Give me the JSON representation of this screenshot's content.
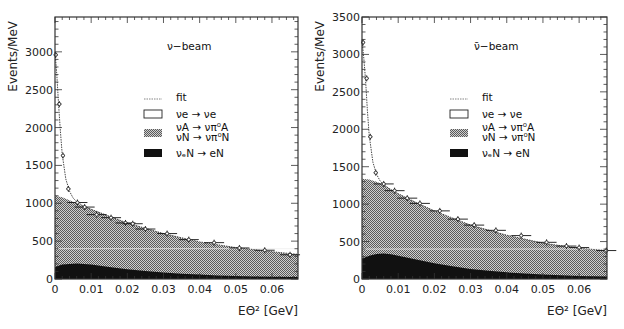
{
  "chart_data": [
    {
      "type": "area",
      "title": "ν−beam",
      "xlabel": "EΘ² [GeV]",
      "ylabel": "Events/MeV",
      "xlim": [
        0,
        0.0672
      ],
      "ylim": [
        0,
        3460
      ],
      "xticks": [
        0,
        0.01,
        0.02,
        0.03,
        0.04,
        0.05,
        0.06
      ],
      "xtick_labels": [
        "0",
        "0.01",
        "0.02",
        "0.03",
        "0.04",
        "0.05",
        "0.06"
      ],
      "yticks": [
        0,
        500,
        1000,
        1500,
        2000,
        2500,
        3000
      ],
      "ytick_labels": [
        "0",
        "500",
        "1000",
        "1500",
        "2000",
        "2500",
        "3000"
      ],
      "grid": false,
      "legend_position": "upper-right-center",
      "legend": [
        {
          "label": "fit",
          "style": "dotted-line"
        },
        {
          "label": "νe → νe",
          "style": "open-box"
        },
        {
          "label": "νA → νπ⁰A",
          "label2": "νN → νπ⁰N",
          "style": "hatched-box"
        },
        {
          "label": "νₑN → eN",
          "style": "solid-box"
        }
      ],
      "series": [
        {
          "name": "νₑN → eN",
          "fill": "#111111",
          "x": [
            0,
            0.002,
            0.004,
            0.006,
            0.008,
            0.01,
            0.015,
            0.02,
            0.025,
            0.03,
            0.035,
            0.04,
            0.045,
            0.05,
            0.055,
            0.06,
            0.0672
          ],
          "values": [
            160,
            190,
            200,
            205,
            200,
            190,
            160,
            130,
            105,
            85,
            70,
            58,
            48,
            40,
            34,
            30,
            25
          ]
        },
        {
          "name": "νA → νπ⁰A + νN → νπ⁰N (cumulative)",
          "fill": "#9a9a9a",
          "x": [
            0,
            0.002,
            0.004,
            0.006,
            0.008,
            0.01,
            0.015,
            0.02,
            0.025,
            0.03,
            0.035,
            0.04,
            0.045,
            0.05,
            0.055,
            0.06,
            0.065,
            0.0672
          ],
          "values": [
            1100,
            1080,
            1040,
            1000,
            960,
            920,
            830,
            740,
            665,
            600,
            540,
            490,
            450,
            415,
            385,
            360,
            330,
            325
          ]
        },
        {
          "name": "fit (total incl. νe → νe)",
          "x": [
            0,
            0.0005,
            0.001,
            0.0015,
            0.002,
            0.003,
            0.004,
            0.005,
            0.006,
            0.008,
            0.01,
            0.015,
            0.02,
            0.03,
            0.04,
            0.05,
            0.06,
            0.0672
          ],
          "values": [
            3000,
            2700,
            2300,
            1950,
            1650,
            1320,
            1160,
            1070,
            1020,
            960,
            920,
            830,
            740,
            600,
            490,
            415,
            360,
            325
          ]
        }
      ],
      "data_points": {
        "x": [
          0.0002,
          0.0012,
          0.0022,
          0.0037,
          0.0062,
          0.0082,
          0.0115,
          0.0155,
          0.0195,
          0.0215,
          0.025,
          0.031,
          0.037,
          0.044,
          0.051,
          0.058,
          0.065
        ],
        "y": [
          2960,
          2310,
          1630,
          1190,
          1010,
          950,
          850,
          810,
          740,
          730,
          660,
          600,
          520,
          480,
          410,
          380,
          320
        ]
      }
    },
    {
      "type": "area",
      "title": "ν̄−beam",
      "xlabel": "EΘ² [GeV]",
      "ylabel": "Events/MeV",
      "xlim": [
        0,
        0.0677
      ],
      "ylim": [
        0,
        3500
      ],
      "xticks": [
        0,
        0.01,
        0.02,
        0.03,
        0.04,
        0.05,
        0.06
      ],
      "xtick_labels": [
        "0",
        "0.01",
        "0.02",
        "0.03",
        "0.04",
        "0.05",
        "0.06"
      ],
      "yticks": [
        0,
        500,
        1000,
        1500,
        2000,
        2500,
        3000,
        3500
      ],
      "ytick_labels": [
        "0",
        "500",
        "1000",
        "1500",
        "2000",
        "2500",
        "3000",
        "3500"
      ],
      "grid": false,
      "legend_position": "upper-right-center",
      "legend": [
        {
          "label": "fit",
          "style": "dotted-line"
        },
        {
          "label": "νe → νe",
          "style": "open-box"
        },
        {
          "label": "νA → νπ⁰A",
          "label2": "νN → νπ⁰N",
          "style": "hatched-box"
        },
        {
          "label": "νₑN → eN",
          "style": "solid-box"
        }
      ],
      "series": [
        {
          "name": "νₑN → eN",
          "fill": "#111111",
          "x": [
            0,
            0.002,
            0.004,
            0.006,
            0.008,
            0.01,
            0.015,
            0.02,
            0.025,
            0.03,
            0.035,
            0.04,
            0.045,
            0.05,
            0.055,
            0.06,
            0.0677
          ],
          "values": [
            270,
            310,
            335,
            340,
            330,
            310,
            260,
            210,
            170,
            135,
            110,
            90,
            72,
            60,
            50,
            42,
            35
          ]
        },
        {
          "name": "νA → νπ⁰A + νN → νπ⁰N (cumulative)",
          "fill": "#9a9a9a",
          "x": [
            0,
            0.002,
            0.004,
            0.006,
            0.008,
            0.01,
            0.015,
            0.02,
            0.025,
            0.03,
            0.035,
            0.04,
            0.045,
            0.05,
            0.055,
            0.06,
            0.065,
            0.0677
          ],
          "values": [
            1340,
            1330,
            1300,
            1260,
            1200,
            1140,
            1020,
            910,
            810,
            720,
            650,
            585,
            530,
            480,
            440,
            410,
            385,
            380
          ]
        },
        {
          "name": "fit (total incl. νe → νe)",
          "x": [
            0,
            0.0005,
            0.001,
            0.0015,
            0.002,
            0.003,
            0.004,
            0.005,
            0.006,
            0.008,
            0.01,
            0.015,
            0.02,
            0.03,
            0.04,
            0.05,
            0.06,
            0.0677
          ],
          "values": [
            3200,
            2950,
            2650,
            2250,
            1920,
            1560,
            1400,
            1310,
            1260,
            1190,
            1140,
            1020,
            910,
            720,
            585,
            480,
            410,
            380
          ]
        }
      ],
      "data_points": {
        "x": [
          0.0003,
          0.0013,
          0.0023,
          0.0038,
          0.006,
          0.009,
          0.0125,
          0.016,
          0.0215,
          0.0265,
          0.031,
          0.037,
          0.044,
          0.051,
          0.0565,
          0.06,
          0.0675
        ],
        "y": [
          3160,
          2680,
          1900,
          1420,
          1270,
          1180,
          1080,
          1010,
          910,
          800,
          720,
          650,
          580,
          490,
          440,
          420,
          380
        ]
      }
    }
  ],
  "panels": [
    {
      "beam_label": "ν−beam",
      "ylabel": "Events/MeV",
      "xlabel": "EΘ² [GeV]"
    },
    {
      "beam_label": "ν̄−beam",
      "ylabel": "Events/MeV",
      "xlabel": "EΘ² [GeV]"
    }
  ],
  "colors": {
    "hatch_fill": "#9a9a9a",
    "solid_fill": "#111111",
    "axis": "#222222",
    "background": "#ffffff"
  }
}
